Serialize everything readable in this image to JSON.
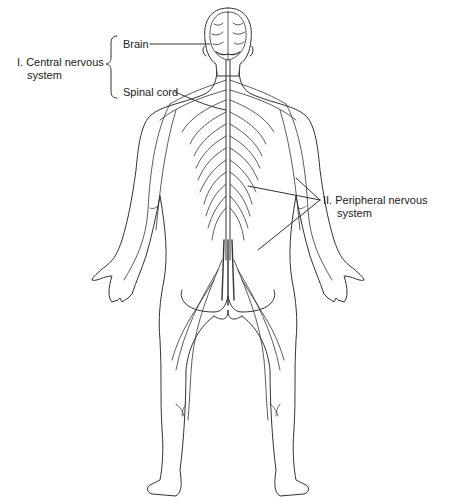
{
  "diagram": {
    "labels": {
      "brain": "Brain",
      "spinal_cord": "Spinal cord",
      "cns_line1": "I. Central nervous",
      "cns_line2": "system",
      "pns_line1": "II. Peripheral nervous",
      "pns_line2": "system"
    },
    "colors": {
      "line": "#333333",
      "background": "#ffffff"
    }
  }
}
